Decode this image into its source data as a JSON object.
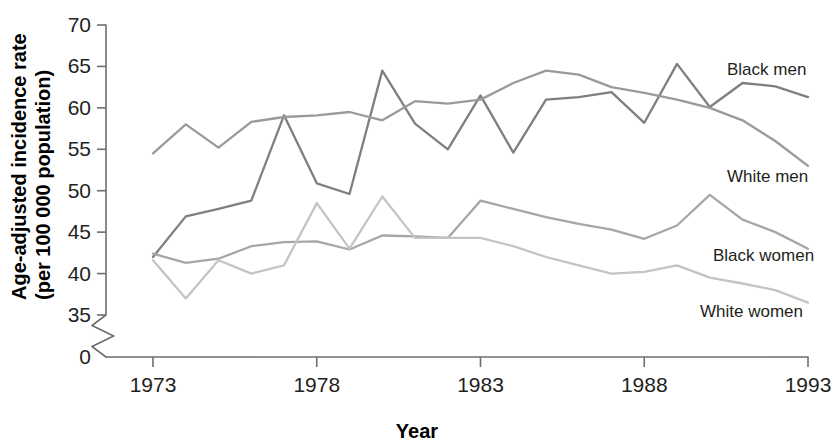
{
  "chart_data": {
    "type": "line",
    "title": "",
    "xlabel": "Year",
    "ylabel": "Age-adjusted incidence rate (per 100 000 population)",
    "ylabel_line1": "Age-adjusted incidence rate",
    "ylabel_line2": "(per 100 000 population)",
    "xlim": [
      1973,
      1993
    ],
    "ylim": [
      35,
      70
    ],
    "y_axis_break": true,
    "y_break_label": "0",
    "grid": false,
    "legend_position": "right-inline",
    "x": [
      1973,
      1974,
      1975,
      1976,
      1977,
      1978,
      1979,
      1980,
      1981,
      1982,
      1983,
      1984,
      1985,
      1986,
      1987,
      1988,
      1989,
      1990,
      1991,
      1992,
      1993
    ],
    "xticks": [
      1973,
      1978,
      1983,
      1988,
      1993
    ],
    "xticklabels": [
      "1973",
      "1978",
      "1983",
      "1988",
      "1993"
    ],
    "yticks": [
      35,
      40,
      45,
      50,
      55,
      60,
      65,
      70
    ],
    "yticklabels": [
      "35",
      "40",
      "45",
      "50",
      "55",
      "60",
      "65",
      "70"
    ],
    "series": [
      {
        "name": "Black men",
        "color": "#7f7f7f",
        "label": "Black men",
        "values": [
          42.0,
          46.9,
          47.8,
          48.8,
          59.1,
          50.9,
          49.6,
          64.5,
          58.1,
          55.0,
          61.5,
          54.6,
          61.0,
          61.3,
          61.9,
          58.2,
          65.3,
          60.1,
          63.0,
          62.6,
          61.3
        ]
      },
      {
        "name": "White men",
        "color": "#9a9a9a",
        "label": "White men",
        "values": [
          54.5,
          58.0,
          55.2,
          58.3,
          58.9,
          59.1,
          59.5,
          58.5,
          60.8,
          60.5,
          61.0,
          63.0,
          64.5,
          64.0,
          62.5,
          61.8,
          61.0,
          60.0,
          58.5,
          56.0,
          53.0
        ]
      },
      {
        "name": "Black women",
        "color": "#a6a6a6",
        "label": "Black women",
        "values": [
          42.4,
          41.3,
          41.8,
          43.3,
          43.8,
          43.9,
          42.9,
          44.6,
          44.5,
          44.3,
          48.8,
          47.8,
          46.8,
          46.0,
          45.3,
          44.2,
          45.8,
          49.5,
          46.5,
          45.0,
          43.0
        ]
      },
      {
        "name": "White women",
        "color": "#c4c4c4",
        "label": "White women",
        "values": [
          41.6,
          37.0,
          41.6,
          40.0,
          41.0,
          48.5,
          43.0,
          49.3,
          44.3,
          44.3,
          44.3,
          43.3,
          42.0,
          41.0,
          40.0,
          40.2,
          41.0,
          39.5,
          38.8,
          38.0,
          36.5
        ]
      }
    ]
  },
  "axes": {
    "x_title": "Year",
    "y_title_line1": "Age-adjusted incidence rate",
    "y_title_line2": "(per 100 000 population)"
  }
}
